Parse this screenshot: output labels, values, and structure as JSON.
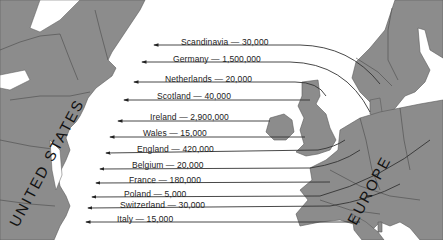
{
  "map": {
    "title": "European Immigration to the United States",
    "regions": {
      "united_states": "UNITED STATES",
      "europe": "EUROPE"
    },
    "colors": {
      "land": "#8c8c8c",
      "water": "#ffffff",
      "arrow": "#333333"
    },
    "migrations": [
      {
        "origin": "Scandinavia",
        "count": "30,000",
        "label": "Scandinavia — 30,000"
      },
      {
        "origin": "Germany",
        "count": "1,500,000",
        "label": "Germany — 1,500,000"
      },
      {
        "origin": "Netherlands",
        "count": "20,000",
        "label": "Netherlands — 20,000"
      },
      {
        "origin": "Scotland",
        "count": "40,000",
        "label": "Scotland — 40,000"
      },
      {
        "origin": "Ireland",
        "count": "2,900,000",
        "label": "Ireland — 2,900,000"
      },
      {
        "origin": "Wales",
        "count": "15,000",
        "label": "Wales — 15,000"
      },
      {
        "origin": "England",
        "count": "420,000",
        "label": "England — 420,000"
      },
      {
        "origin": "Belgium",
        "count": "20,000",
        "label": "Belgium — 20,000"
      },
      {
        "origin": "France",
        "count": "180,000",
        "label": "France — 180,000"
      },
      {
        "origin": "Poland",
        "count": "5,000",
        "label": "Poland — 5,000"
      },
      {
        "origin": "Switzerland",
        "count": "30,000",
        "label": "Switzerland — 30,000"
      },
      {
        "origin": "Italy",
        "count": "15,000",
        "label": "Italy — 15,000"
      }
    ]
  }
}
